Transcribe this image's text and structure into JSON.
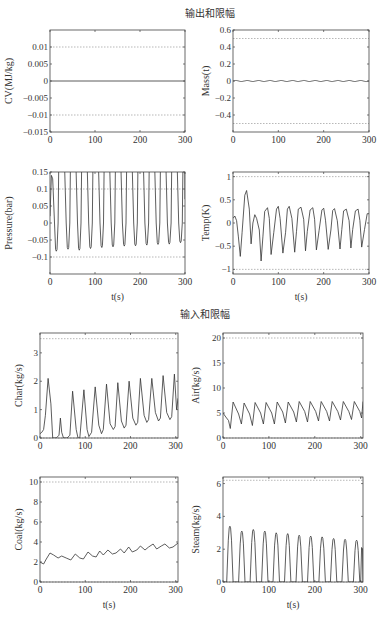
{
  "figure": {
    "group_titles": [
      "输出和限幅",
      "输入和限幅"
    ],
    "xlabel": "t(s)"
  },
  "chart_data": [
    {
      "type": "line",
      "group": "输出和限幅",
      "ylabel": "CV(MJ/kg)",
      "xlim": [
        0,
        300
      ],
      "ylim": [
        -0.015,
        0.015
      ],
      "xticks": [
        0,
        100,
        200,
        300
      ],
      "xtick_labels": [
        "0",
        "100",
        "200",
        "300"
      ],
      "yticks": [
        -0.015,
        -0.01,
        -0.005,
        0,
        0.005,
        0.01
      ],
      "ytick_labels": [
        "−0.015",
        "−0.01",
        "−0.005",
        "0",
        "0.005",
        "0.01"
      ],
      "limits": [
        -0.01,
        0.01
      ],
      "series": [
        {
          "name": "CV",
          "x": [
            0,
            300
          ],
          "values": [
            0,
            0
          ]
        }
      ],
      "frame": [
        50,
        30,
        185,
        132
      ],
      "show_xlabel": false
    },
    {
      "type": "line",
      "group": "输出和限幅",
      "ylabel": "Mass(t)",
      "xlim": [
        0,
        300
      ],
      "ylim": [
        -0.6,
        0.6
      ],
      "xticks": [
        0,
        100,
        200,
        300
      ],
      "xtick_labels": [
        "0",
        "100",
        "200",
        "300"
      ],
      "yticks": [
        -0.4,
        -0.2,
        0,
        0.2,
        0.4,
        0.6
      ],
      "ytick_labels": [
        "−0.4",
        "−0.2",
        "0",
        "0.2",
        "0.4",
        "0.6"
      ],
      "limits": [
        -0.5,
        0.5
      ],
      "series": [
        {
          "name": "Mass",
          "x": [
            0,
            300
          ],
          "values": [
            0.005,
            0
          ],
          "wave": {
            "period": 25,
            "amp": 0.006,
            "offset": 0,
            "shape": "sine"
          }
        }
      ],
      "frame": [
        233,
        30,
        369,
        132
      ],
      "show_xlabel": false
    },
    {
      "type": "line",
      "group": "输出和限幅",
      "ylabel": "Pressure(bar)",
      "xlim": [
        0,
        300
      ],
      "ylim": [
        -0.15,
        0.15
      ],
      "xticks": [
        0,
        100,
        200,
        300
      ],
      "xtick_labels": [
        "0",
        "100",
        "200",
        "300"
      ],
      "yticks": [
        -0.1,
        -0.05,
        0,
        0.05,
        0.1,
        0.15
      ],
      "ytick_labels": [
        "−0.1",
        "−0.05",
        "0",
        "0.05",
        "0.1",
        "0.15"
      ],
      "limits": [
        -0.1,
        0.1
      ],
      "series": [
        {
          "name": "Pressure",
          "troughs_t": [
            14,
            40,
            65,
            90,
            115,
            140,
            165,
            190,
            215,
            240,
            265,
            290
          ],
          "troughs_v": [
            -0.083,
            -0.077,
            -0.08,
            -0.075,
            -0.072,
            -0.07,
            -0.068,
            -0.067,
            -0.065,
            -0.063,
            -0.062,
            -0.058
          ],
          "peak_v": 0.6
        }
      ],
      "frame": [
        50,
        172,
        185,
        274
      ],
      "show_xlabel": true
    },
    {
      "type": "line",
      "group": "输出和限幅",
      "ylabel": "Temp(K)",
      "xlim": [
        0,
        300
      ],
      "ylim": [
        -1.1,
        1.1
      ],
      "xticks": [
        0,
        100,
        200,
        300
      ],
      "xtick_labels": [
        "0",
        "100",
        "200",
        "300"
      ],
      "yticks": [
        -1,
        -0.5,
        0,
        0.5,
        1
      ],
      "ytick_labels": [
        "−1",
        "−0.5",
        "0",
        "0.5",
        "1"
      ],
      "limits": [
        -1,
        1
      ],
      "series": [
        {
          "name": "Temp",
          "points_t": [
            0,
            4,
            8,
            12,
            16,
            20,
            26,
            30,
            36,
            40,
            44,
            48,
            52,
            58,
            62,
            66,
            70,
            76,
            80,
            84,
            90,
            96,
            100,
            104,
            110,
            116,
            120,
            124,
            130,
            136,
            140,
            144,
            150,
            156,
            160,
            164,
            170,
            176,
            180,
            184,
            190,
            196,
            200,
            204,
            210,
            216,
            220,
            224,
            230,
            236,
            240,
            244,
            250,
            256,
            260,
            264,
            270,
            276,
            280,
            284,
            290,
            296,
            300
          ],
          "points_v": [
            0.1,
            0.15,
            0.05,
            -0.3,
            -0.72,
            -0.2,
            0.6,
            0.7,
            0.3,
            -0.45,
            0.0,
            0.18,
            0.1,
            -0.15,
            -0.82,
            -0.3,
            0.25,
            0.33,
            0.1,
            -0.68,
            -0.2,
            0.3,
            0.36,
            0.1,
            -0.65,
            -0.2,
            0.3,
            0.36,
            0.1,
            -0.63,
            -0.18,
            0.3,
            0.34,
            0.08,
            -0.6,
            -0.18,
            0.28,
            0.33,
            0.08,
            -0.58,
            -0.16,
            0.28,
            0.32,
            0.06,
            -0.57,
            -0.15,
            0.27,
            0.31,
            0.05,
            -0.56,
            -0.14,
            0.26,
            0.3,
            0.05,
            -0.54,
            -0.14,
            0.26,
            0.3,
            0.05,
            -0.52,
            -0.14,
            0.2,
            0.2
          ]
        }
      ],
      "frame": [
        233,
        172,
        369,
        274
      ],
      "show_xlabel": true
    },
    {
      "type": "line",
      "group": "输入和限幅",
      "ylabel": "Char(kg/s)",
      "xlim": [
        0,
        305
      ],
      "ylim": [
        0,
        3.7
      ],
      "xticks": [
        0,
        100,
        200,
        300
      ],
      "xtick_labels": [
        "0",
        "100",
        "200",
        "300"
      ],
      "yticks": [
        0,
        1,
        2,
        3
      ],
      "ytick_labels": [
        "0",
        "1",
        "2",
        "3"
      ],
      "limits": [
        0,
        3.5
      ],
      "series": [
        {
          "name": "Char",
          "points_t": [
            0,
            4,
            8,
            12,
            18,
            24,
            28,
            36,
            42,
            45,
            48,
            52,
            60,
            66,
            72,
            80,
            84,
            88,
            97,
            104,
            108,
            114,
            122,
            130,
            136,
            140,
            147,
            155,
            162,
            166,
            172,
            180,
            186,
            190,
            197,
            205,
            212,
            216,
            222,
            230,
            236,
            240,
            247,
            255,
            262,
            266,
            272,
            280,
            287,
            291,
            297,
            302,
            305
          ],
          "points_v": [
            0.15,
            0.2,
            0.3,
            0.8,
            2.1,
            1.2,
            0.0,
            0.0,
            0.1,
            0.7,
            0.2,
            0.0,
            0.0,
            0.1,
            1.65,
            0.3,
            0.0,
            0.0,
            1.7,
            0.3,
            0.05,
            0.2,
            1.8,
            0.45,
            0.15,
            0.3,
            1.9,
            0.5,
            0.3,
            0.4,
            1.95,
            0.6,
            0.35,
            0.45,
            2.0,
            0.7,
            0.45,
            0.55,
            2.1,
            0.8,
            0.55,
            0.65,
            2.1,
            0.9,
            0.6,
            0.7,
            2.2,
            0.9,
            0.65,
            0.75,
            2.25,
            1.0,
            1.4
          ]
        }
      ],
      "frame": [
        40,
        333,
        178,
        438
      ],
      "show_xlabel": false
    },
    {
      "type": "line",
      "group": "输入和限幅",
      "ylabel": "Air(kg/s)",
      "xlim": [
        0,
        305
      ],
      "ylim": [
        0,
        21
      ],
      "xticks": [
        0,
        100,
        200,
        300
      ],
      "xtick_labels": [
        "0",
        "100",
        "200",
        "300"
      ],
      "yticks": [
        0,
        5,
        10,
        15,
        20
      ],
      "ytick_labels": [
        "0",
        "5",
        "10",
        "15",
        "20"
      ],
      "limits": [
        0,
        20
      ],
      "series": [
        {
          "name": "Air",
          "points_t": [
            0,
            6,
            12,
            16,
            22,
            34,
            40,
            46,
            58,
            64,
            70,
            82,
            88,
            94,
            106,
            112,
            118,
            130,
            136,
            142,
            154,
            160,
            166,
            178,
            184,
            190,
            202,
            208,
            214,
            226,
            232,
            238,
            250,
            256,
            262,
            274,
            280,
            286,
            298,
            302,
            305
          ],
          "points_v": [
            5,
            4.2,
            3.5,
            1.9,
            7.2,
            4.8,
            2.8,
            7.0,
            4.8,
            2.5,
            7.1,
            5.0,
            2.8,
            7.1,
            5.0,
            2.8,
            7.2,
            5.2,
            3.0,
            7.2,
            5.2,
            3.2,
            7.3,
            5.3,
            3.2,
            7.3,
            5.3,
            3.4,
            7.3,
            5.3,
            3.4,
            7.3,
            5.3,
            3.6,
            7.3,
            5.3,
            3.7,
            7.3,
            5.3,
            4.0,
            7.3
          ]
        }
      ],
      "frame": [
        223,
        333,
        363,
        438
      ],
      "show_xlabel": false
    },
    {
      "type": "line",
      "group": "输入和限幅",
      "ylabel": "Coal(kg/s)",
      "xlim": [
        0,
        305
      ],
      "ylim": [
        0,
        10.5
      ],
      "xticks": [
        0,
        100,
        200,
        300
      ],
      "xtick_labels": [
        "0",
        "100",
        "200",
        "300"
      ],
      "yticks": [
        0,
        2,
        4,
        6,
        8,
        10
      ],
      "ytick_labels": [
        "0",
        "2",
        "4",
        "6",
        "8",
        "10"
      ],
      "limits": [
        0,
        10
      ],
      "series": [
        {
          "name": "Coal",
          "points_t": [
            0,
            8,
            14,
            22,
            30,
            40,
            48,
            58,
            68,
            78,
            88,
            96,
            106,
            116,
            124,
            132,
            140,
            150,
            160,
            168,
            178,
            186,
            196,
            204,
            214,
            222,
            232,
            240,
            250,
            258,
            268,
            276,
            286,
            294,
            305
          ],
          "points_v": [
            2.0,
            1.8,
            2.3,
            2.9,
            2.7,
            2.4,
            2.6,
            2.4,
            2.2,
            2.8,
            2.4,
            2.3,
            3.0,
            2.6,
            2.5,
            3.1,
            2.7,
            3.2,
            2.8,
            2.9,
            3.3,
            2.9,
            3.5,
            3.0,
            3.2,
            3.6,
            3.2,
            3.5,
            3.8,
            3.3,
            3.6,
            3.8,
            3.4,
            3.5,
            3.9
          ]
        }
      ],
      "frame": [
        40,
        477,
        178,
        582
      ],
      "show_xlabel": true
    },
    {
      "type": "line",
      "group": "输入和限幅",
      "ylabel": "Steam(kg/s)",
      "xlim": [
        0,
        305
      ],
      "ylim": [
        0,
        6.4
      ],
      "xticks": [
        0,
        100,
        200,
        300
      ],
      "xtick_labels": [
        "0",
        "100",
        "200",
        "300"
      ],
      "yticks": [
        0,
        2,
        4,
        6
      ],
      "ytick_labels": [
        "0",
        "2",
        "4",
        "6"
      ],
      "limits": [
        0,
        6.2
      ],
      "series": [
        {
          "name": "Steam",
          "peaks_t": [
            15,
            41,
            66,
            91,
            116,
            141,
            166,
            191,
            216,
            241,
            266,
            291
          ],
          "peaks_v": [
            3.4,
            3.1,
            3.2,
            3.1,
            3.0,
            2.95,
            2.85,
            2.8,
            2.75,
            2.65,
            2.6,
            2.55
          ],
          "half_width": 7
        }
      ],
      "frame": [
        223,
        477,
        363,
        582
      ],
      "show_xlabel": true
    }
  ]
}
